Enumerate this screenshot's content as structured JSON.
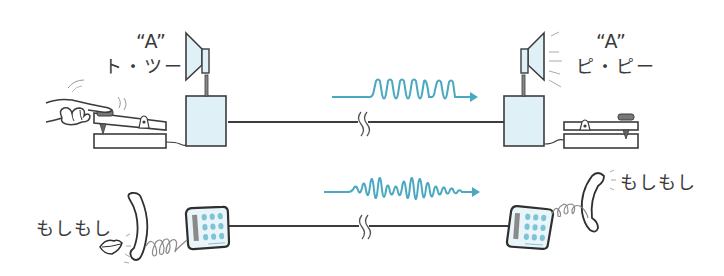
{
  "diagram": {
    "colors": {
      "line": "#3c3c3c",
      "device_fill": "#dff1f7",
      "signal": "#4aa8c0",
      "keypad_button": "#7fc4d6",
      "panel_gray": "#8a8a8a"
    },
    "telegraph": {
      "sender": {
        "letter": "“A”",
        "morse_kana": "ト・ツー"
      },
      "receiver": {
        "letter": "“A”",
        "morse_kana": "ピ・ピー"
      },
      "signal_type": "on-off pulses"
    },
    "telephone": {
      "sender": {
        "speech": "もしもし"
      },
      "receiver": {
        "speech": "もしもし"
      },
      "signal_type": "continuous varying wave"
    }
  }
}
